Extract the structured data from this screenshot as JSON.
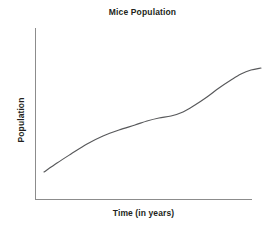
{
  "chart_data": {
    "type": "line",
    "title": "Mice Population",
    "xlabel": "Time (in years)",
    "ylabel": "Population",
    "grid": false,
    "legend": "none",
    "axis_color": "#8c8c8c",
    "line_color": "#58595b",
    "background": "#ffffff",
    "xlim": [
      0,
      10
    ],
    "ylim": [
      0,
      10
    ],
    "x_tick_labels": [],
    "y_tick_labels": [],
    "annotations": [],
    "x": [
      0.4,
      1.2,
      2.0,
      2.8,
      3.6,
      4.4,
      5.2,
      6.0,
      6.8,
      7.6,
      8.4,
      9.2,
      9.7
    ],
    "y": [
      1.65,
      2.35,
      3.05,
      3.65,
      4.15,
      4.35,
      4.55,
      5.15,
      5.95,
      6.75,
      7.35,
      7.65,
      7.75
    ],
    "series": [
      {
        "name": "Population",
        "values": [
          1.65,
          2.35,
          3.05,
          3.65,
          4.15,
          4.35,
          4.55,
          5.15,
          5.95,
          6.75,
          7.35,
          7.65,
          7.75
        ]
      }
    ],
    "path_points_px": [
      [
        9,
        144
      ],
      [
        22,
        135
      ],
      [
        36,
        126
      ],
      [
        52,
        116
      ],
      [
        68,
        108
      ],
      [
        84,
        102
      ],
      [
        100,
        97
      ],
      [
        112,
        93
      ],
      [
        124,
        90
      ],
      [
        136,
        88
      ],
      [
        148,
        84
      ],
      [
        160,
        77
      ],
      [
        172,
        69
      ],
      [
        184,
        60
      ],
      [
        196,
        52
      ],
      [
        206,
        46
      ],
      [
        216,
        42
      ],
      [
        226,
        40
      ]
    ]
  }
}
